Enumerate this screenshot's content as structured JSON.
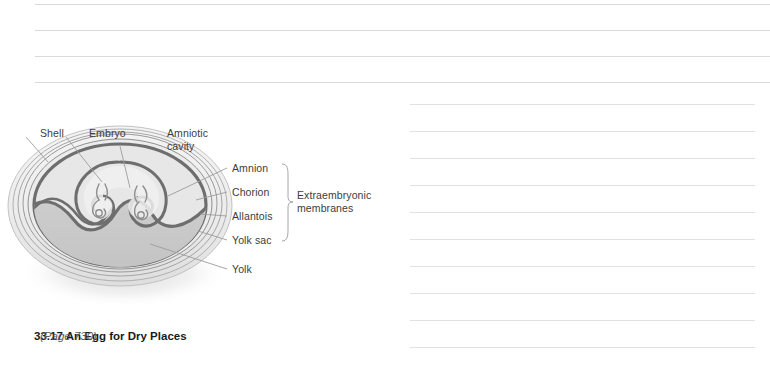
{
  "figure": {
    "caption_number": "33.17",
    "caption_title": "An Egg for Dry Places",
    "caption_page": "(Page 730)",
    "labels": {
      "shell": "Shell",
      "embryo": "Embryo",
      "amniotic_cavity": "Amniotic\ncavity",
      "amnion": "Amnion",
      "chorion": "Chorion",
      "allantois": "Allantois",
      "yolk_sac": "Yolk sac",
      "yolk": "Yolk",
      "extraembryonic_membranes": "Extraembryonic\nmembranes"
    },
    "colors": {
      "membrane_dark": "#6e6e6e",
      "shell_ring": "#9a9a9a",
      "albumen_fill": "#e9e9e9",
      "yolk_fill": "#c9c9c9",
      "leader_line": "#9c9c9c",
      "label_text": "#3c3c3c",
      "rule_line": "#d8d9da"
    }
  },
  "notes": {
    "top_rules": [
      {
        "x": 35,
        "y": 4,
        "width": 735
      },
      {
        "x": 35,
        "y": 30,
        "width": 735
      },
      {
        "x": 35,
        "y": 56,
        "width": 735
      },
      {
        "x": 35,
        "y": 82,
        "width": 735
      }
    ],
    "right_rules": [
      {
        "x": 410,
        "y": 104,
        "width": 345
      },
      {
        "x": 410,
        "y": 131,
        "width": 345
      },
      {
        "x": 410,
        "y": 158,
        "width": 345
      },
      {
        "x": 410,
        "y": 185,
        "width": 345
      },
      {
        "x": 410,
        "y": 212,
        "width": 345
      },
      {
        "x": 410,
        "y": 239,
        "width": 345
      },
      {
        "x": 410,
        "y": 266,
        "width": 345
      },
      {
        "x": 410,
        "y": 293,
        "width": 345
      },
      {
        "x": 410,
        "y": 320,
        "width": 345
      },
      {
        "x": 410,
        "y": 347,
        "width": 345
      }
    ]
  }
}
